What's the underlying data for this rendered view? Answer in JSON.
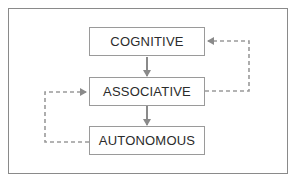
{
  "diagram": {
    "type": "flow",
    "stages": [
      {
        "id": "cognitive",
        "label": "COGNITIVE"
      },
      {
        "id": "associative",
        "label": "ASSOCIATIVE"
      },
      {
        "id": "autonomous",
        "label": "AUTONOMOUS"
      }
    ],
    "edges": [
      {
        "from": "cognitive",
        "to": "associative",
        "style": "solid"
      },
      {
        "from": "associative",
        "to": "autonomous",
        "style": "solid"
      },
      {
        "from": "associative",
        "to": "cognitive",
        "style": "dashed",
        "side": "right"
      },
      {
        "from": "autonomous",
        "to": "associative",
        "style": "dashed",
        "side": "left"
      }
    ],
    "colors": {
      "text": "#2b2b2b",
      "border": "#9a9a9a",
      "arrow": "#8a8a8a"
    }
  }
}
